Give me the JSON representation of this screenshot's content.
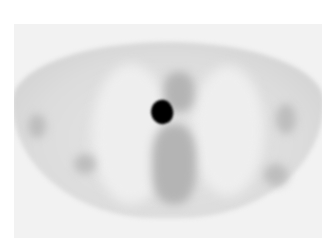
{
  "image": {
    "type": "PET scan axial slice",
    "description": "Grayscale axial thoracic PET image showing a focal intense uptake (black spot) near the midline/mediastinum",
    "colors": {
      "background": "#ffffff",
      "frame": "#f2f2f2",
      "tissue": "#d8d8d8",
      "lung": "#eeeeee",
      "hotspot": "#000000"
    }
  }
}
